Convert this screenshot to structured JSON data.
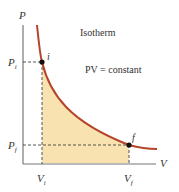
{
  "diagram": {
    "title": "Isotherm",
    "equation": "PV = constant",
    "axes": {
      "x_label": "V",
      "y_label": "P"
    },
    "points": [
      {
        "name": "i",
        "p_label": "P_i",
        "v_label": "V_i"
      },
      {
        "name": "f",
        "p_label": "P_f",
        "v_label": "V_f"
      }
    ],
    "labels": {
      "point_i": "i",
      "point_f": "f",
      "pi_main": "P",
      "pi_sub": "i",
      "pf_main": "P",
      "pf_sub": "f",
      "vi_main": "V",
      "vi_sub": "i",
      "vf_main": "V",
      "vf_sub": "f"
    },
    "colors": {
      "curve": "#b5442a",
      "fill": "#f7e2b0",
      "axis": "#666666",
      "dash": "#444444"
    }
  }
}
